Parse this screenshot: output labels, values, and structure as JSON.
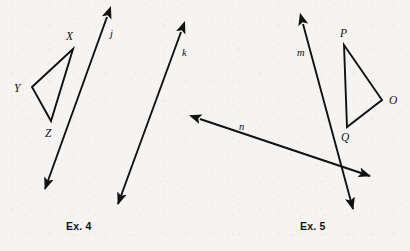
{
  "page": {
    "background_color": "#f5f4f2",
    "ink_color": "#111111",
    "width": 410,
    "height": 251
  },
  "figures": [
    {
      "id": "ex4",
      "caption": "Ex. 4",
      "caption_pos": {
        "x": 66,
        "y": 220
      },
      "polygons": [
        {
          "name": "triangle-xyz",
          "vertices": [
            {
              "label": "X",
              "x": 73,
              "y": 49,
              "label_x": 66,
              "label_y": 40
            },
            {
              "label": "Y",
              "x": 32,
              "y": 87,
              "label_x": 14,
              "label_y": 92
            },
            {
              "label": "Z",
              "x": 51,
              "y": 121,
              "label_x": 45,
              "label_y": 137
            }
          ]
        }
      ],
      "lines": [
        {
          "label": "j",
          "x1": 107,
          "y1": 17,
          "x2": 45,
          "y2": 189,
          "arrow_start": true,
          "arrow_end": true,
          "label_x": 110,
          "label_y": 37
        },
        {
          "label": "k",
          "x1": 181,
          "y1": 32,
          "x2": 118,
          "y2": 204,
          "arrow_start": true,
          "arrow_end": true,
          "label_x": 182,
          "label_y": 56
        }
      ]
    },
    {
      "id": "ex5",
      "caption": "Ex. 5",
      "caption_pos": {
        "x": 300,
        "y": 220
      },
      "polygons": [
        {
          "name": "triangle-pqo",
          "vertices": [
            {
              "label": "P",
              "x": 344,
              "y": 45,
              "label_x": 340,
              "label_y": 37
            },
            {
              "label": "O",
              "x": 382,
              "y": 100,
              "label_x": 389,
              "label_y": 104
            },
            {
              "label": "Q",
              "x": 347,
              "y": 127,
              "label_x": 341,
              "label_y": 141
            }
          ]
        }
      ],
      "lines": [
        {
          "label": "m",
          "x1": 303,
          "y1": 24,
          "x2": 353,
          "y2": 209,
          "arrow_start": true,
          "arrow_end": true,
          "label_x": 297,
          "label_y": 56
        },
        {
          "label": "n",
          "x1": 200,
          "y1": 119,
          "x2": 370,
          "y2": 176,
          "arrow_start": true,
          "arrow_end": true,
          "label_x": 239,
          "label_y": 130
        }
      ]
    }
  ]
}
